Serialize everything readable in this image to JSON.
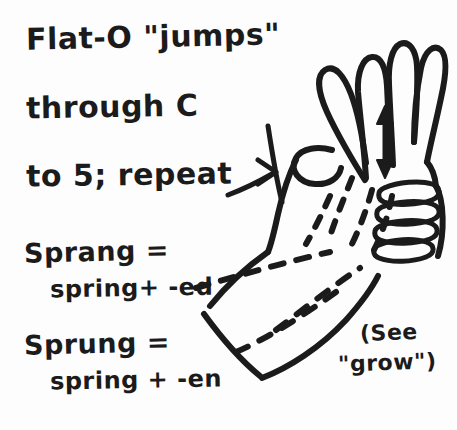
{
  "note": {
    "kind": "handwritten-sign-language-note",
    "ink_color": "#1b1b1b",
    "paper_color": "#fdfdfd",
    "instruction_lines": [
      "Flat-O \"jumps\"",
      "through C",
      "to 5; repeat"
    ],
    "glosses": [
      {
        "headword": "Sprang =",
        "derivation": "spring+ -ed"
      },
      {
        "headword": "Sprung =",
        "derivation": "spring + -en"
      }
    ],
    "cross_reference": {
      "line1": "(See",
      "line2": "\"grow\")"
    },
    "illustration": {
      "subject": "right hand opening from Flat-O through C to 5 handshape",
      "arrow": "double-headed vertical arrow showing repeated up-down motion",
      "motion_trails": "dashed lines indicating repeated movement",
      "leader_line": "arrow pointing from the word repeat toward the hand"
    }
  }
}
